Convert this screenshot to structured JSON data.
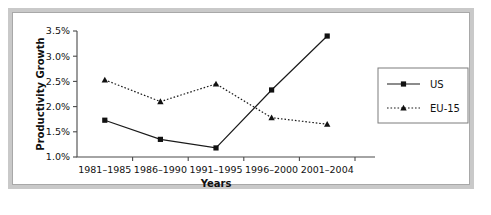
{
  "figure": {
    "background_color": "#ffffff",
    "frame_color": "#c9c9c9",
    "plot_background": "#ffffff",
    "caption": ""
  },
  "legend": {
    "position": "right",
    "entries": [
      {
        "label": "US",
        "style": "solid",
        "marker": "square"
      },
      {
        "label": "EU-15",
        "style": "dotted",
        "marker": "triangle"
      }
    ]
  },
  "axes": {
    "y_ticks": [
      "1.0%",
      "1.5%",
      "2.0%",
      "2.5%",
      "3.0%",
      "3.5%"
    ],
    "x_ticks": [
      "1981–1985",
      "1986–1990",
      "1991–1995",
      "1996–2000",
      "2001–2004"
    ],
    "y_title": "Productivity Growth",
    "x_title": "Years"
  },
  "chart_data": {
    "type": "line",
    "title": "",
    "xlabel": "Years",
    "ylabel": "Productivity Growth",
    "categories": [
      "1981–1985",
      "1986–1990",
      "1991–1995",
      "1996–2000",
      "2001–2004"
    ],
    "series": [
      {
        "name": "US",
        "values": [
          1.73,
          1.35,
          1.18,
          2.33,
          3.4
        ],
        "line_style": "solid",
        "marker": "square",
        "color": "#111111"
      },
      {
        "name": "EU-15",
        "values": [
          2.53,
          2.1,
          2.45,
          1.78,
          1.65
        ],
        "line_style": "dotted",
        "marker": "triangle",
        "color": "#111111"
      }
    ],
    "ylim": [
      1.0,
      3.5
    ],
    "y_tick_values": [
      1.0,
      1.5,
      2.0,
      2.5,
      3.0,
      3.5
    ],
    "y_unit": "%",
    "grid": false,
    "legend_position": "right"
  }
}
